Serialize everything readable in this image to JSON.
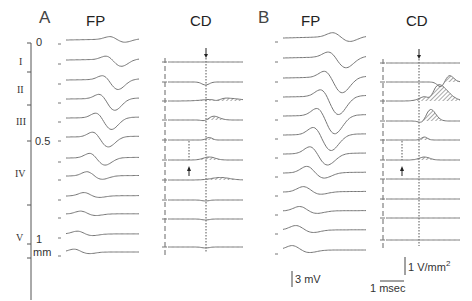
{
  "figure": {
    "panel_a": {
      "letter": "A",
      "fp_title": "FP",
      "cd_title": "CD"
    },
    "panel_b": {
      "letter": "B",
      "fp_title": "FP",
      "cd_title": "CD"
    },
    "depth_axis": {
      "ticks": [
        "0",
        "0.5",
        "1"
      ],
      "unit": "mm",
      "layers": [
        "I",
        "II",
        "III",
        "IV",
        "V"
      ]
    },
    "scale_bars": {
      "voltage": "3 mV",
      "current_density_value": "1 V/mm",
      "current_density_exp": "2",
      "time": "1 msec"
    },
    "colors": {
      "trace": "#777777",
      "axis": "#555555",
      "hatch": "#555555"
    }
  },
  "chart_data": [
    {
      "type": "line",
      "title": "A FP",
      "description": "Laminar field potential profiles, 12 traces, depth 0 to ~1.1 mm",
      "n_traces": 12,
      "xlabel": "time (msec)",
      "ylabel": "depth (mm)",
      "depth_ticks": [
        0,
        0.5,
        1
      ]
    },
    {
      "type": "line",
      "title": "A CD",
      "description": "Current density profiles, 10 traces, with small hatched sinks near traces 3-7; downward arrow at top, upward arrow at trace 6",
      "n_traces": 10,
      "hatched_traces": [
        3,
        4,
        5,
        6,
        7
      ]
    },
    {
      "type": "line",
      "title": "B FP",
      "description": "Laminar field potential profiles, 12 traces, larger amplitude",
      "n_traces": 12
    },
    {
      "type": "line",
      "title": "B CD",
      "description": "Current density profiles, 10 traces, with large hatched sinks near traces 2-6; downward arrow at top, upward arrow at trace 6",
      "n_traces": 10,
      "hatched_traces": [
        2,
        3,
        4,
        5,
        6
      ]
    }
  ]
}
